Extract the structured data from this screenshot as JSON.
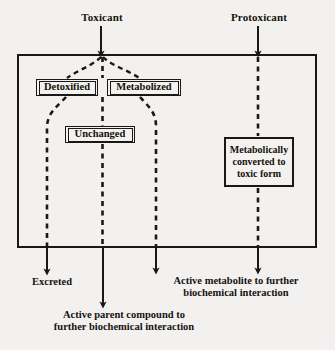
{
  "diagram": {
    "colors": {
      "background": "#f2f1ef",
      "ink": "#1a1814",
      "box_fill": "#f3f2f0"
    },
    "sources": [
      {
        "id": "toxicant",
        "label": "Toxicant",
        "arrow_x": 101
      },
      {
        "id": "protoxicant",
        "label": "Protoxicant",
        "arrow_x": 258
      }
    ],
    "organism_frame": {
      "name": "organism-boundary",
      "x": 18,
      "y": 55,
      "width": 298,
      "height": 192
    },
    "nodes": [
      {
        "id": "detoxified",
        "label": "Detoxified",
        "border": "double"
      },
      {
        "id": "metabolized",
        "label": "Metabolized",
        "border": "double"
      },
      {
        "id": "unchanged",
        "label": "Unchanged",
        "border": "double"
      },
      {
        "id": "converted",
        "label": "Metabolically\nconverted to\ntoxic form",
        "border": "single"
      }
    ],
    "outcomes": [
      {
        "id": "excreted",
        "label": "Excreted",
        "arrow_x": 47
      },
      {
        "id": "active-parent",
        "label": "Active parent compound to\nfurther biochemical interaction",
        "arrow_x": 103
      },
      {
        "id": "active-metab",
        "label": "Active metabolite to further\nbiochemical interaction",
        "arrow_x": 156
      },
      {
        "id": "toxic-metab",
        "label": "",
        "arrow_x": 258
      }
    ],
    "flow_paths": [
      {
        "from": "toxicant",
        "to": "detoxified",
        "style": "dashed"
      },
      {
        "from": "toxicant",
        "to": "unchanged",
        "style": "dashed"
      },
      {
        "from": "toxicant",
        "to": "metabolized",
        "style": "dashed"
      },
      {
        "from": "detoxified",
        "to": "excreted",
        "style": "dashed"
      },
      {
        "from": "unchanged",
        "to": "active-parent",
        "style": "dashed"
      },
      {
        "from": "metabolized",
        "to": "active-metab",
        "style": "dashed"
      },
      {
        "from": "protoxicant",
        "to": "converted",
        "style": "dashed"
      },
      {
        "from": "converted",
        "to": "toxic-metab",
        "style": "dashed"
      }
    ]
  }
}
